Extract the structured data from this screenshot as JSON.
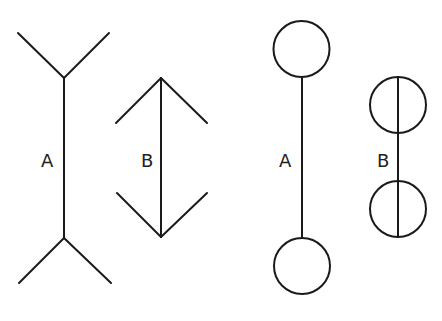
{
  "figure": {
    "left_panel": {
      "figure_a": {
        "label": "A",
        "shaft": {
          "x": 64,
          "y1": 78,
          "y2": 238
        },
        "top_fins": [
          [
            18,
            33,
            64,
            78
          ],
          [
            109,
            33,
            64,
            78
          ]
        ],
        "bottom_fins": [
          [
            19,
            283,
            64,
            238
          ],
          [
            111,
            283,
            64,
            238
          ]
        ],
        "label_pos": [
          42,
          166
        ]
      },
      "figure_b": {
        "label": "B",
        "shaft": {
          "x": 161,
          "y1": 78,
          "y2": 237
        },
        "top_fins": [
          [
            116,
            123,
            161,
            78
          ],
          [
            207,
            123,
            161,
            78
          ]
        ],
        "bottom_fins": [
          [
            117,
            193,
            161,
            237
          ],
          [
            207,
            193,
            161,
            237
          ]
        ],
        "label_pos": [
          141,
          166
        ]
      }
    },
    "right_panel": {
      "figure_a": {
        "label": "A",
        "shaft": {
          "x": 302,
          "y1": 77,
          "y2": 238
        },
        "circles": [
          {
            "cx": 301.5,
            "cy": 49,
            "r": 28
          },
          {
            "cx": 302,
            "cy": 266,
            "r": 28
          }
        ],
        "label_pos": [
          280,
          166
        ]
      },
      "figure_b": {
        "label": "B",
        "shaft": {
          "x": 398,
          "y1": 77,
          "y2": 237
        },
        "circles": [
          {
            "cx": 398,
            "cy": 105,
            "r": 28
          },
          {
            "cx": 398,
            "cy": 209,
            "r": 28
          }
        ],
        "label_pos": [
          378,
          166
        ]
      }
    },
    "colors": {
      "stroke": "#1a1a1a",
      "label": "#222222",
      "background": "#ffffff"
    }
  }
}
